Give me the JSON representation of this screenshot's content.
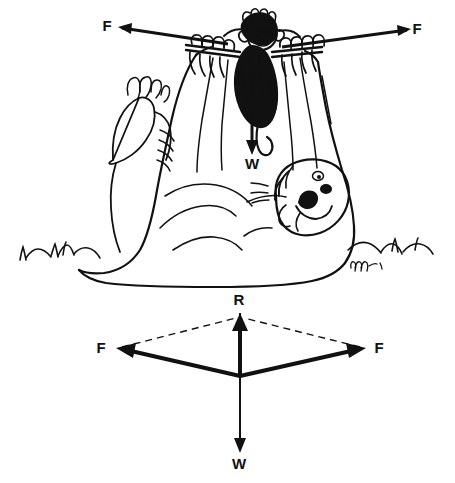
{
  "figure": {
    "background_color": "#ffffff",
    "ink_color": "#111111",
    "width": 455,
    "height": 483,
    "cartoon": {
      "name": "gorilla-bar-cartoon",
      "description": "Cartoon of a reclining gorilla holding a horizontal bar overhead while a small monkey hangs from the middle of the bar",
      "signature": "mw -81",
      "labels": [
        {
          "id": "cartoon-force-left",
          "text": "F",
          "x": 107,
          "y": 31
        },
        {
          "id": "cartoon-force-right",
          "text": "F",
          "x": 415,
          "y": 34
        },
        {
          "id": "cartoon-weight",
          "text": "W",
          "x": 246,
          "y": 166
        }
      ],
      "arrows": [
        {
          "id": "cartoon-arrow-left-F",
          "from": [
            228,
            44
          ],
          "to": [
            118,
            27
          ],
          "style": "solid"
        },
        {
          "id": "cartoon-arrow-right-F",
          "from": [
            282,
            47
          ],
          "to": [
            411,
            29
          ],
          "style": "solid"
        },
        {
          "id": "cartoon-arrow-weight-W",
          "from": [
            252,
            62
          ],
          "to": [
            252,
            153
          ],
          "style": "solid"
        }
      ]
    },
    "vector_diagram": {
      "name": "parallelogram-of-forces",
      "description": "Parallelogram of forces: two equal F vectors combine to give resultant R, balancing weight W",
      "origin": [
        240,
        376
      ],
      "labels": [
        {
          "id": "vector-resultant",
          "text": "R",
          "x": 239,
          "y": 303
        },
        {
          "id": "vector-force-left",
          "text": "F",
          "x": 101,
          "y": 352
        },
        {
          "id": "vector-force-right",
          "text": "F",
          "x": 377,
          "y": 352
        },
        {
          "id": "vector-weight",
          "text": "W",
          "x": 239,
          "y": 467
        }
      ],
      "vectors": [
        {
          "id": "resultant-R",
          "label": "R",
          "from": [
            240,
            376
          ],
          "to": [
            240,
            314
          ],
          "style": "solid",
          "weight": "heavy"
        },
        {
          "id": "force-left-F",
          "label": "F",
          "from": [
            240,
            376
          ],
          "to": [
            118,
            348
          ],
          "style": "solid",
          "weight": "heavy"
        },
        {
          "id": "force-right-F",
          "label": "F",
          "from": [
            240,
            376
          ],
          "to": [
            364,
            348
          ],
          "style": "solid",
          "weight": "heavy"
        },
        {
          "id": "weight-W",
          "label": "W",
          "from": [
            240,
            376
          ],
          "to": [
            240,
            452
          ],
          "style": "solid",
          "weight": "light"
        }
      ],
      "construction_lines": [
        {
          "id": "dashed-left",
          "from": [
            118,
            348
          ],
          "to": [
            240,
            316
          ],
          "style": "dashed"
        },
        {
          "id": "dashed-right",
          "from": [
            364,
            348
          ],
          "to": [
            240,
            316
          ],
          "style": "dashed"
        }
      ]
    }
  }
}
